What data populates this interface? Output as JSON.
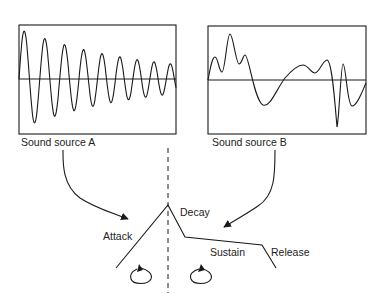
{
  "panels": [
    {
      "id": "A",
      "label": "Sound source A",
      "waveform": "decaying oscillation"
    },
    {
      "id": "B",
      "label": "Sound source B",
      "waveform": "irregular complex waveform"
    }
  ],
  "envelope": {
    "stages": [
      {
        "name": "attack",
        "label": "Attack"
      },
      {
        "name": "decay",
        "label": "Decay"
      },
      {
        "name": "sustain",
        "label": "Sustain"
      },
      {
        "name": "release",
        "label": "Release"
      }
    ],
    "loop_icons": [
      "loop-left",
      "loop-right"
    ]
  },
  "colors": {
    "line": "#1a1a1a",
    "text": "#222222",
    "background": "#ffffff"
  }
}
